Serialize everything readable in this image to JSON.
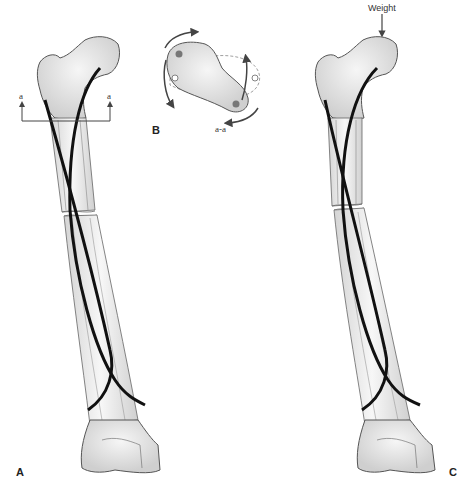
{
  "figure": {
    "panels": [
      {
        "id": "A",
        "label": "A",
        "description": "Femur with two crossed flexible intramedullary nails; section line a-a across proximal femur",
        "section_marker_left": "a",
        "section_marker_right": "a"
      },
      {
        "id": "B",
        "label": "B",
        "description": "Cross-section a-a showing rotation of femoral segment",
        "section_label": "a-a"
      },
      {
        "id": "C",
        "label": "C",
        "description": "Femur with crossed nails under axial load",
        "load_label": "Weight"
      }
    ],
    "colors": {
      "bone_fill": "#e2e2e2",
      "bone_outline": "#555555",
      "nail": "#111111",
      "arrow": "#444444"
    }
  }
}
